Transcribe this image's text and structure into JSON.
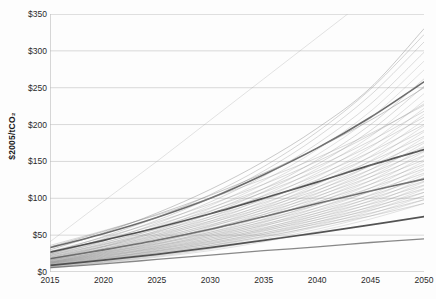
{
  "chart_data": {
    "type": "line",
    "title": "",
    "subtitle": "",
    "xlabel": "",
    "ylabel": "$2005/tCO2",
    "ylabel_display": "$2005/tCO₂",
    "xlim": [
      2015,
      2050
    ],
    "ylim": [
      0,
      350
    ],
    "grid": "horizontal",
    "legend": "none",
    "annotations": [],
    "x": [
      2015,
      2020,
      2025,
      2030,
      2035,
      2040,
      2045,
      2050
    ],
    "xticks": [
      "2015",
      "2020",
      "2025",
      "2030",
      "2035",
      "2040",
      "2045",
      "2050"
    ],
    "yticks": [
      "$0",
      "$50",
      "$100",
      "$150",
      "$200",
      "$250",
      "$300",
      "$350"
    ],
    "ytick_values": [
      0,
      50,
      100,
      150,
      200,
      250,
      300,
      350
    ],
    "series_count": 62,
    "series": [
      {
        "name": "scenario-01",
        "shade": "#9a9a9a",
        "opacity": 0.35,
        "width": 0.8,
        "values": [
          41,
          96,
          150,
          206,
          262,
          318,
          374,
          430
        ]
      },
      {
        "name": "scenario-02",
        "shade": "#5a5a5a",
        "opacity": 0.9,
        "width": 1.6,
        "values": [
          33,
          52,
          74,
          100,
          132,
          168,
          210,
          258
        ]
      },
      {
        "name": "scenario-03",
        "shade": "#7a7a7a",
        "opacity": 0.5,
        "width": 0.8,
        "values": [
          30,
          53,
          80,
          112,
          150,
          195,
          250,
          330
        ]
      },
      {
        "name": "scenario-04",
        "shade": "#8a8a8a",
        "opacity": 0.45,
        "width": 0.8,
        "values": [
          26,
          48,
          74,
          105,
          143,
          190,
          248,
          322
        ]
      },
      {
        "name": "scenario-05",
        "shade": "#8a8a8a",
        "opacity": 0.4,
        "width": 0.8,
        "values": [
          24,
          45,
          70,
          100,
          137,
          183,
          240,
          312
        ]
      },
      {
        "name": "scenario-06",
        "shade": "#909090",
        "opacity": 0.4,
        "width": 0.8,
        "values": [
          22,
          42,
          66,
          95,
          130,
          174,
          228,
          298
        ]
      },
      {
        "name": "scenario-07",
        "shade": "#9a9a9a",
        "opacity": 0.35,
        "width": 0.8,
        "values": [
          20,
          39,
          62,
          90,
          124,
          166,
          218,
          286
        ]
      },
      {
        "name": "scenario-08",
        "shade": "#9a9a9a",
        "opacity": 0.35,
        "width": 0.8,
        "values": [
          19,
          37,
          59,
          86,
          119,
          159,
          209,
          274
        ]
      },
      {
        "name": "scenario-09",
        "shade": "#8a8a8a",
        "opacity": 0.4,
        "width": 0.8,
        "values": [
          18,
          35,
          56,
          82,
          113,
          152,
          200,
          262
        ]
      },
      {
        "name": "scenario-10",
        "shade": "#7a7a7a",
        "opacity": 0.45,
        "width": 0.9,
        "values": [
          34,
          55,
          78,
          104,
          134,
          168,
          206,
          250
        ]
      },
      {
        "name": "scenario-11",
        "shade": "#8a8a8a",
        "opacity": 0.4,
        "width": 0.8,
        "values": [
          17,
          34,
          54,
          79,
          109,
          146,
          192,
          252
        ]
      },
      {
        "name": "scenario-12",
        "shade": "#9a9a9a",
        "opacity": 0.35,
        "width": 0.8,
        "values": [
          16,
          32,
          51,
          75,
          104,
          140,
          184,
          242
        ]
      },
      {
        "name": "scenario-13",
        "shade": "#8a8a8a",
        "opacity": 0.4,
        "width": 0.8,
        "values": [
          36,
          56,
          77,
          100,
          126,
          155,
          188,
          226
        ]
      },
      {
        "name": "scenario-14",
        "shade": "#9a9a9a",
        "opacity": 0.35,
        "width": 0.8,
        "values": [
          15,
          31,
          49,
          72,
          100,
          134,
          176,
          232
        ]
      },
      {
        "name": "scenario-15",
        "shade": "#8a8a8a",
        "opacity": 0.4,
        "width": 0.8,
        "values": [
          28,
          47,
          68,
          92,
          119,
          150,
          186,
          228
        ]
      },
      {
        "name": "scenario-16",
        "shade": "#9a9a9a",
        "opacity": 0.35,
        "width": 0.8,
        "values": [
          14,
          29,
          47,
          69,
          96,
          129,
          169,
          222
        ]
      },
      {
        "name": "scenario-17",
        "shade": "#8a8a8a",
        "opacity": 0.4,
        "width": 0.8,
        "values": [
          26,
          44,
          64,
          87,
          113,
          143,
          178,
          218
        ]
      },
      {
        "name": "scenario-18",
        "shade": "#9a9a9a",
        "opacity": 0.35,
        "width": 0.8,
        "values": [
          13,
          28,
          45,
          66,
          92,
          124,
          163,
          214
        ]
      },
      {
        "name": "scenario-19",
        "shade": "#8a8a8a",
        "opacity": 0.4,
        "width": 0.8,
        "values": [
          25,
          42,
          61,
          83,
          108,
          137,
          171,
          210
        ]
      },
      {
        "name": "scenario-20",
        "shade": "#9a9a9a",
        "opacity": 0.35,
        "width": 0.8,
        "values": [
          13,
          27,
          43,
          63,
          88,
          119,
          157,
          206
        ]
      },
      {
        "name": "scenario-21",
        "shade": "#4a4a4a",
        "opacity": 0.95,
        "width": 1.7,
        "values": [
          27,
          43,
          60,
          79,
          100,
          122,
          145,
          166
        ]
      },
      {
        "name": "scenario-22",
        "shade": "#8a8a8a",
        "opacity": 0.4,
        "width": 0.8,
        "values": [
          24,
          40,
          58,
          79,
          103,
          131,
          163,
          200
        ]
      },
      {
        "name": "scenario-23",
        "shade": "#9a9a9a",
        "opacity": 0.35,
        "width": 0.8,
        "values": [
          12,
          26,
          41,
          61,
          85,
          115,
          151,
          198
        ]
      },
      {
        "name": "scenario-24",
        "shade": "#8a8a8a",
        "opacity": 0.4,
        "width": 0.8,
        "values": [
          23,
          38,
          55,
          75,
          98,
          125,
          156,
          192
        ]
      },
      {
        "name": "scenario-25",
        "shade": "#9a9a9a",
        "opacity": 0.35,
        "width": 0.8,
        "values": [
          12,
          25,
          40,
          58,
          81,
          110,
          145,
          190
        ]
      },
      {
        "name": "scenario-26",
        "shade": "#8a8a8a",
        "opacity": 0.4,
        "width": 0.8,
        "values": [
          22,
          37,
          53,
          72,
          94,
          120,
          150,
          184
        ]
      },
      {
        "name": "scenario-27",
        "shade": "#9a9a9a",
        "opacity": 0.35,
        "width": 0.8,
        "values": [
          11,
          24,
          38,
          56,
          78,
          106,
          139,
          182
        ]
      },
      {
        "name": "scenario-28",
        "shade": "#8a8a8a",
        "opacity": 0.4,
        "width": 0.8,
        "values": [
          21,
          35,
          51,
          69,
          90,
          115,
          144,
          177
        ]
      },
      {
        "name": "scenario-29",
        "shade": "#9a9a9a",
        "opacity": 0.35,
        "width": 0.8,
        "values": [
          11,
          23,
          37,
          54,
          75,
          102,
          134,
          175
        ]
      },
      {
        "name": "scenario-30",
        "shade": "#8a8a8a",
        "opacity": 0.4,
        "width": 0.8,
        "values": [
          20,
          34,
          49,
          67,
          87,
          111,
          139,
          170
        ]
      },
      {
        "name": "scenario-31",
        "shade": "#9a9a9a",
        "opacity": 0.35,
        "width": 0.8,
        "values": [
          10,
          22,
          35,
          52,
          72,
          98,
          129,
          169
        ]
      },
      {
        "name": "scenario-32",
        "shade": "#8a8a8a",
        "opacity": 0.4,
        "width": 0.8,
        "values": [
          19,
          32,
          47,
          64,
          84,
          107,
          134,
          164
        ]
      },
      {
        "name": "scenario-33",
        "shade": "#9a9a9a",
        "opacity": 0.35,
        "width": 0.8,
        "values": [
          10,
          21,
          34,
          50,
          69,
          94,
          124,
          163
        ]
      },
      {
        "name": "scenario-34",
        "shade": "#8a8a8a",
        "opacity": 0.4,
        "width": 0.8,
        "values": [
          18,
          31,
          45,
          62,
          81,
          103,
          129,
          158
        ]
      },
      {
        "name": "scenario-35",
        "shade": "#5a5a5a",
        "opacity": 0.9,
        "width": 1.6,
        "values": [
          18,
          30,
          43,
          58,
          75,
          93,
          110,
          126
        ]
      },
      {
        "name": "scenario-36",
        "shade": "#9a9a9a",
        "opacity": 0.35,
        "width": 0.8,
        "values": [
          9,
          20,
          33,
          48,
          67,
          91,
          119,
          157
        ]
      },
      {
        "name": "scenario-37",
        "shade": "#8a8a8a",
        "opacity": 0.4,
        "width": 0.8,
        "values": [
          17,
          30,
          43,
          59,
          78,
          99,
          124,
          152
        ]
      },
      {
        "name": "scenario-38",
        "shade": "#9a9a9a",
        "opacity": 0.35,
        "width": 0.8,
        "values": [
          9,
          19,
          31,
          46,
          64,
          87,
          114,
          150
        ]
      },
      {
        "name": "scenario-39",
        "shade": "#8a8a8a",
        "opacity": 0.4,
        "width": 0.8,
        "values": [
          16,
          28,
          41,
          57,
          75,
          95,
          119,
          146
        ]
      },
      {
        "name": "scenario-40",
        "shade": "#9a9a9a",
        "opacity": 0.35,
        "width": 0.8,
        "values": [
          9,
          18,
          30,
          44,
          62,
          84,
          110,
          144
        ]
      },
      {
        "name": "scenario-41",
        "shade": "#8a8a8a",
        "opacity": 0.4,
        "width": 0.8,
        "values": [
          16,
          27,
          39,
          54,
          71,
          91,
          114,
          140
        ]
      },
      {
        "name": "scenario-42",
        "shade": "#9a9a9a",
        "opacity": 0.35,
        "width": 0.8,
        "values": [
          8,
          18,
          29,
          42,
          59,
          80,
          105,
          138
        ]
      },
      {
        "name": "scenario-43",
        "shade": "#8a8a8a",
        "opacity": 0.4,
        "width": 0.8,
        "values": [
          15,
          26,
          38,
          52,
          68,
          87,
          109,
          134
        ]
      },
      {
        "name": "scenario-44",
        "shade": "#9a9a9a",
        "opacity": 0.35,
        "width": 0.8,
        "values": [
          8,
          17,
          28,
          41,
          57,
          77,
          101,
          132
        ]
      },
      {
        "name": "scenario-45",
        "shade": "#8a8a8a",
        "opacity": 0.4,
        "width": 0.8,
        "values": [
          14,
          25,
          36,
          50,
          65,
          83,
          104,
          128
        ]
      },
      {
        "name": "scenario-46",
        "shade": "#9a9a9a",
        "opacity": 0.35,
        "width": 0.8,
        "values": [
          8,
          16,
          27,
          39,
          55,
          74,
          97,
          127
        ]
      },
      {
        "name": "scenario-47",
        "shade": "#8a8a8a",
        "opacity": 0.4,
        "width": 0.8,
        "values": [
          14,
          24,
          35,
          48,
          63,
          80,
          100,
          123
        ]
      },
      {
        "name": "scenario-48",
        "shade": "#9a9a9a",
        "opacity": 0.35,
        "width": 0.8,
        "values": [
          7,
          16,
          26,
          38,
          53,
          71,
          93,
          122
        ]
      },
      {
        "name": "scenario-49",
        "shade": "#8a8a8a",
        "opacity": 0.4,
        "width": 0.8,
        "values": [
          13,
          23,
          33,
          46,
          60,
          77,
          96,
          118
        ]
      },
      {
        "name": "scenario-50",
        "shade": "#9a9a9a",
        "opacity": 0.35,
        "width": 0.8,
        "values": [
          7,
          15,
          25,
          36,
          51,
          68,
          89,
          117
        ]
      },
      {
        "name": "scenario-51",
        "shade": "#8a8a8a",
        "opacity": 0.4,
        "width": 0.8,
        "values": [
          13,
          22,
          32,
          44,
          58,
          74,
          92,
          113
        ]
      },
      {
        "name": "scenario-52",
        "shade": "#9a9a9a",
        "opacity": 0.35,
        "width": 0.8,
        "values": [
          7,
          14,
          24,
          35,
          49,
          66,
          86,
          112
        ]
      },
      {
        "name": "scenario-53",
        "shade": "#8a8a8a",
        "opacity": 0.4,
        "width": 0.8,
        "values": [
          12,
          21,
          31,
          42,
          56,
          71,
          88,
          108
        ]
      },
      {
        "name": "scenario-54",
        "shade": "#9a9a9a",
        "opacity": 0.35,
        "width": 0.8,
        "values": [
          6,
          14,
          23,
          34,
          47,
          63,
          83,
          108
        ]
      },
      {
        "name": "scenario-55",
        "shade": "#8a8a8a",
        "opacity": 0.4,
        "width": 0.8,
        "values": [
          12,
          20,
          29,
          40,
          53,
          68,
          84,
          103
        ]
      },
      {
        "name": "scenario-56",
        "shade": "#9a9a9a",
        "opacity": 0.35,
        "width": 0.8,
        "values": [
          6,
          13,
          22,
          32,
          45,
          61,
          79,
          103
        ]
      },
      {
        "name": "scenario-57",
        "shade": "#8a8a8a",
        "opacity": 0.4,
        "width": 0.8,
        "values": [
          11,
          19,
          28,
          38,
          51,
          65,
          80,
          98
        ]
      },
      {
        "name": "scenario-58",
        "shade": "#9a9a9a",
        "opacity": 0.35,
        "width": 0.8,
        "values": [
          6,
          13,
          21,
          31,
          43,
          58,
          76,
          98
        ]
      },
      {
        "name": "scenario-59",
        "shade": "#8a8a8a",
        "opacity": 0.4,
        "width": 0.8,
        "values": [
          10,
          18,
          26,
          36,
          48,
          62,
          76,
          93
        ]
      },
      {
        "name": "scenario-60",
        "shade": "#9a9a9a",
        "opacity": 0.35,
        "width": 0.8,
        "values": [
          5,
          12,
          20,
          29,
          41,
          55,
          72,
          93
        ]
      },
      {
        "name": "scenario-61",
        "shade": "#4a4a4a",
        "opacity": 0.95,
        "width": 1.7,
        "values": [
          9,
          16,
          24,
          33,
          43,
          53,
          64,
          75
        ]
      },
      {
        "name": "scenario-62",
        "shade": "#6a6a6a",
        "opacity": 0.8,
        "width": 1.3,
        "values": [
          6,
          11,
          17,
          23,
          29,
          34,
          40,
          45
        ]
      }
    ]
  },
  "axis": {
    "axis_color": "#b6b6b6",
    "grid_color": "#c9c9c9",
    "tick_text_color": "#2a2a2a"
  }
}
